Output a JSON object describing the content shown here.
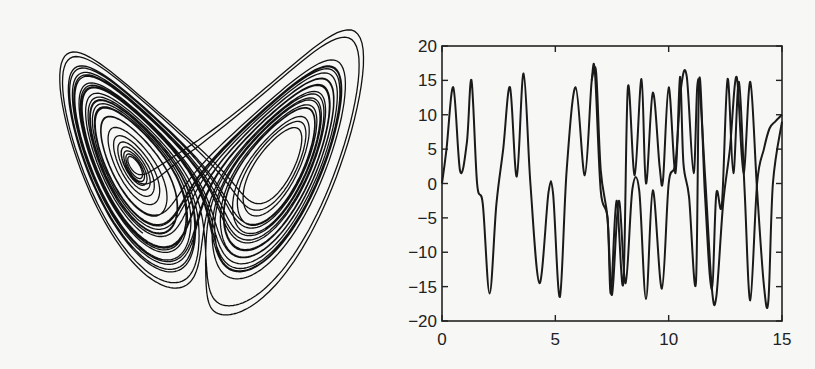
{
  "chart_data": [
    {
      "type": "line",
      "panel": "left",
      "description": "Lorenz attractor phase portrait (butterfly), no axes",
      "title": "",
      "xlabel": "",
      "ylabel": "",
      "axes_visible": false,
      "lobes": [
        {
          "name": "left lobe",
          "center": [
            155,
            165
          ]
        },
        {
          "name": "right lobe",
          "center": [
            290,
            165
          ]
        }
      ]
    },
    {
      "type": "line",
      "panel": "right",
      "title": "",
      "xlabel": "",
      "ylabel": "",
      "xlim": [
        0,
        15
      ],
      "ylim": [
        -20,
        20
      ],
      "xticks": [
        0,
        5,
        10,
        15
      ],
      "yticks": [
        20,
        15,
        10,
        5,
        0,
        -5,
        -10,
        -15,
        -20
      ],
      "grid": false,
      "legend": null,
      "series": [
        {
          "name": "trajectory 1",
          "x": [
            0,
            0.2,
            0.5,
            0.8,
            1.1,
            1.3,
            1.55,
            1.8,
            2.1,
            2.4,
            2.7,
            3.0,
            3.3,
            3.6,
            3.9,
            4.3,
            4.7,
            4.9,
            5.2,
            5.5,
            5.9,
            6.3,
            6.6,
            6.75,
            7.0,
            7.3,
            7.45,
            7.7,
            8.0,
            8.2,
            8.5,
            8.8,
            9.0,
            9.3,
            9.6,
            9.75,
            10.0,
            10.3,
            10.5,
            10.65,
            10.9,
            11.2,
            11.35,
            11.6,
            11.9,
            12.1,
            12.35,
            12.6,
            12.85,
            13.1,
            13.35,
            13.6,
            13.9,
            14.2,
            14.45,
            14.7,
            15.0
          ],
          "y": [
            0,
            5,
            14,
            1.8,
            6,
            15,
            0,
            -3,
            -16,
            -3,
            5,
            14,
            1,
            16,
            0,
            -14.5,
            -1.3,
            -1.5,
            -16.5,
            2,
            14,
            1.2,
            14.8,
            16,
            -1,
            -5,
            -16,
            -2.5,
            -14.5,
            14,
            1.2,
            15.2,
            0,
            13.2,
            2.5,
            0.5,
            14,
            1.5,
            15.5,
            3,
            -2,
            -14.5,
            15.2,
            -1.5,
            -15.5,
            -1.5,
            -3,
            15.2,
            1.5,
            14.8,
            -1,
            -17,
            0,
            5,
            8,
            9,
            10
          ]
        },
        {
          "name": "trajectory 2 (perturbed)",
          "x": [
            6.6,
            6.8,
            7.0,
            7.3,
            7.5,
            7.8,
            8.1,
            8.4,
            8.7,
            9.0,
            9.3,
            9.7,
            10.0,
            10.3,
            10.55,
            10.8,
            11.1,
            11.3,
            11.6,
            11.9,
            12.1,
            12.4,
            12.7,
            13.0,
            13.3,
            13.6,
            13.9,
            14.2,
            14.4,
            14.6,
            15.0
          ],
          "y": [
            15,
            16.2,
            2,
            -5,
            -16.2,
            -2.5,
            -14.5,
            -0.8,
            -1,
            -16.8,
            -1,
            -15.3,
            0,
            3,
            14,
            15.5,
            1.5,
            15.2,
            1.5,
            -15,
            -16.5,
            -3,
            5,
            15.5,
            1.5,
            14.8,
            -1,
            -14.8,
            -17,
            0,
            9
          ]
        }
      ]
    }
  ],
  "axes": {
    "y_tick_labels": [
      "20",
      "15",
      "10",
      "5",
      "0",
      "−5",
      "−10",
      "−15",
      "−20"
    ],
    "x_tick_labels": [
      "0",
      "5",
      "10",
      "15"
    ]
  }
}
